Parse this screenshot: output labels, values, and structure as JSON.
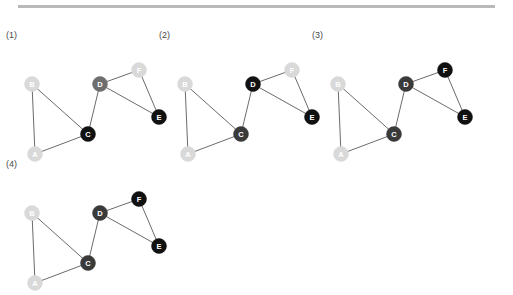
{
  "figure": {
    "rule": {
      "name": "horizontal-rule",
      "color": "#b9b9b9"
    },
    "background": "#ffffff",
    "node_radius": 7.5,
    "edge_color": "#5a5a5a",
    "edge_width": 0.9,
    "shades": {
      "light": "#d9d9d9",
      "light_label": "#ffffff",
      "mid": "#6e6e6e",
      "mid_label": "#ffffff",
      "dark": "#3a3a3a",
      "dark_label": "#ffffff",
      "black": "#111111",
      "black_label": "#ffffff"
    },
    "node_positions": {
      "A": {
        "x": 27,
        "y": 128
      },
      "B": {
        "x": 24,
        "y": 58
      },
      "C": {
        "x": 80,
        "y": 108
      },
      "D": {
        "x": 92,
        "y": 58
      },
      "E": {
        "x": 151,
        "y": 91
      },
      "F": {
        "x": 131,
        "y": 44
      }
    },
    "edges": [
      {
        "from": "A",
        "to": "B"
      },
      {
        "from": "A",
        "to": "C"
      },
      {
        "from": "B",
        "to": "C"
      },
      {
        "from": "C",
        "to": "D"
      },
      {
        "from": "D",
        "to": "E"
      },
      {
        "from": "D",
        "to": "F"
      },
      {
        "from": "E",
        "to": "F"
      }
    ],
    "panels": [
      {
        "id": "panel-1",
        "label": "(1)",
        "origin": {
          "x": 8,
          "y": 26
        },
        "label_pos": {
          "x": 6,
          "y": 30
        },
        "node_states": {
          "A": "light",
          "B": "light",
          "C": "black",
          "D": "mid",
          "E": "black",
          "F": "light"
        }
      },
      {
        "id": "panel-2",
        "label": "(2)",
        "origin": {
          "x": 161,
          "y": 26
        },
        "label_pos": {
          "x": 159,
          "y": 30
        },
        "node_states": {
          "A": "light",
          "B": "light",
          "C": "dark",
          "D": "black",
          "E": "black",
          "F": "light"
        }
      },
      {
        "id": "panel-3",
        "label": "(3)",
        "origin": {
          "x": 314,
          "y": 26
        },
        "label_pos": {
          "x": 312,
          "y": 30
        },
        "node_states": {
          "A": "light",
          "B": "light",
          "C": "dark",
          "D": "dark",
          "E": "black",
          "F": "black"
        }
      },
      {
        "id": "panel-4",
        "label": "(4)",
        "origin": {
          "x": 8,
          "y": 155
        },
        "label_pos": {
          "x": 6,
          "y": 159
        },
        "node_states": {
          "A": "light",
          "B": "light",
          "C": "dark",
          "D": "dark",
          "E": "black",
          "F": "black"
        }
      }
    ],
    "node_ids": [
      "A",
      "B",
      "C",
      "D",
      "E",
      "F"
    ]
  }
}
